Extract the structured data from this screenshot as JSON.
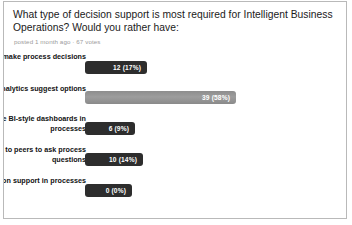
{
  "poll": {
    "question": "What type of decision support is most required for Intelligent Business Operations? Would you rather have:",
    "meta": "posted 1 month ago · 67 votes",
    "total_votes": 67,
    "colors": {
      "bar_default": "#2d2d2d",
      "bar_highlight": "#949494",
      "bar_text": "#ffffff",
      "border": "#b9b9b9",
      "background": "#ffffff",
      "question_text": "#1a1a1a",
      "meta_text": "#9a9a9a",
      "option_text": "#111111"
    },
    "options": [
      {
        "label": "Business rules make process decisions",
        "votes": 12,
        "percent": 17,
        "value_text": "12  (17%)",
        "bar_px": 62,
        "highlight": false
      },
      {
        "label": "Predictive Analytics suggest options",
        "votes": 39,
        "percent": 58,
        "value_text": "39  (58%)",
        "bar_px": 151,
        "highlight": true
      },
      {
        "label": "Simple BI-style dashboards in processes",
        "votes": 6,
        "percent": 9,
        "value_text": "6  (9%)",
        "bar_px": 50,
        "highlight": false
      },
      {
        "label": "Access to peers to ask process questions",
        "votes": 10,
        "percent": 14,
        "value_text": "10  (14%)",
        "bar_px": 58,
        "highlight": false
      },
      {
        "label": "No decision support in processes",
        "votes": 0,
        "percent": 0,
        "value_text": "0  (0%)",
        "bar_px": 47,
        "highlight": false
      }
    ]
  },
  "chart_data": {
    "type": "bar",
    "title": "What type of decision support is most required for Intelligent Business Operations? Would you rather have:",
    "subtitle": "posted 1 month ago · 67 votes",
    "orientation": "horizontal",
    "categories": [
      "Business rules make process decisions",
      "Predictive Analytics suggest options",
      "Simple BI-style dashboards in processes",
      "Access to peers to ask process questions",
      "No decision support in processes"
    ],
    "values": [
      12,
      39,
      6,
      10,
      0
    ],
    "percentages": [
      17,
      58,
      9,
      14,
      0
    ],
    "data_labels": [
      "12  (17%)",
      "39  (58%)",
      "6  (9%)",
      "10  (14%)",
      "0  (0%)"
    ],
    "xlabel": "",
    "ylabel": "",
    "xlim": [
      0,
      39
    ],
    "grid": false,
    "legend": false,
    "total": 67
  }
}
